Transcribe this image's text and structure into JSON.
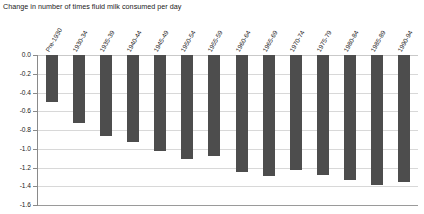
{
  "chart_data": {
    "type": "bar",
    "title": "Change in number of times fluid milk consumed per day",
    "xlabel": "",
    "ylabel": "",
    "ylim": [
      -1.6,
      0.0
    ],
    "yticks": [
      "0.0",
      "-0.2",
      "-0.4",
      "-0.6",
      "-0.8",
      "-1.0",
      "-1.2",
      "-1.4",
      "-1.6"
    ],
    "ytick_values": [
      0.0,
      -0.2,
      -0.4,
      -0.6,
      -0.8,
      -1.0,
      -1.2,
      -1.4,
      -1.6
    ],
    "grid": true,
    "legend": false,
    "orientation": "vertical",
    "bar_color": "#4d4d4d",
    "categories": [
      "Pre-1930",
      "1930-34",
      "1935-39",
      "1940-44",
      "1945-49",
      "1950-54",
      "1955-59",
      "1960-64",
      "1965-69",
      "1970-74",
      "1975-79",
      "1980-84",
      "1985-89",
      "1990-94"
    ],
    "values": [
      -0.5,
      -0.73,
      -0.86,
      -0.93,
      -1.02,
      -1.11,
      -1.08,
      -1.25,
      -1.29,
      -1.23,
      -1.28,
      -1.33,
      -1.39,
      -1.35
    ]
  }
}
